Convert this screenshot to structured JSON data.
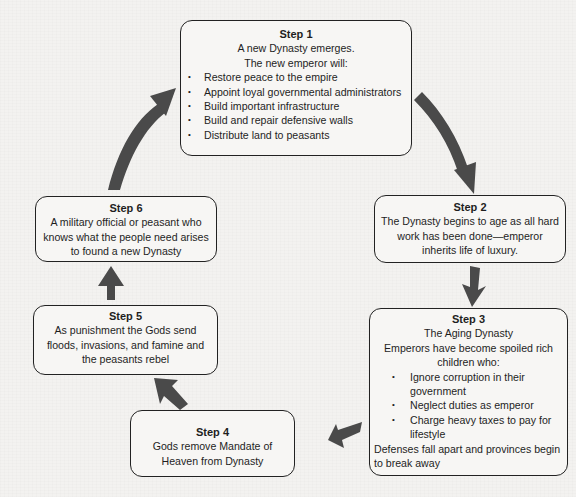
{
  "diagram": {
    "type": "cycle",
    "arrow_color": "#4a4a4a",
    "steps": [
      {
        "title": "Step 1",
        "lines": [
          "A new Dynasty emerges.",
          "The new emperor will:"
        ],
        "bullets": [
          "Restore peace to the empire",
          "Appoint loyal governmental administrators",
          "Build important infrastructure",
          "Build and repair defensive walls",
          "Distribute land to peasants"
        ]
      },
      {
        "title": "Step 2",
        "text": "The Dynasty begins to age as all hard work has been done—emperor inherits life of luxury."
      },
      {
        "title": "Step 3",
        "subtitle": "The Aging Dynasty",
        "intro": "Emperors have become spoiled rich children who:",
        "bullets": [
          "Ignore corruption in their government",
          "Neglect duties as emperor",
          "Charge heavy taxes to pay for lifestyle"
        ],
        "outro": "Defenses fall apart and provinces begin to break away"
      },
      {
        "title": "Step 4",
        "text": "Gods remove Mandate of Heaven from Dynasty"
      },
      {
        "title": "Step 5",
        "text": "As punishment the Gods send floods, invasions, and famine and the peasants rebel"
      },
      {
        "title": "Step 6",
        "text": "A military official or peasant who knows what the people need arises to found a new Dynasty"
      }
    ],
    "connections": [
      {
        "from": "Step 1",
        "to": "Step 2"
      },
      {
        "from": "Step 2",
        "to": "Step 3"
      },
      {
        "from": "Step 3",
        "to": "Step 4"
      },
      {
        "from": "Step 4",
        "to": "Step 5"
      },
      {
        "from": "Step 5",
        "to": "Step 6"
      },
      {
        "from": "Step 6",
        "to": "Step 1"
      }
    ]
  }
}
